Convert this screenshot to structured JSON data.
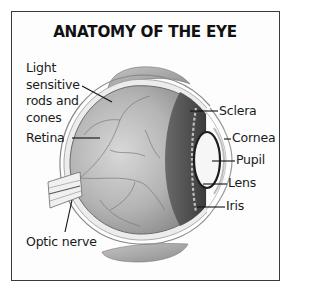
{
  "title": "ANATOMY OF THE EYE",
  "labels": {
    "light_sensitive": [
      "Light",
      "sensitive",
      "rods and",
      "cones"
    ],
    "retina": "Retina",
    "optic_nerve": "Optic nerve",
    "sclera": "Sclera",
    "cornea": "Cornea",
    "pupil": "Pupil",
    "lens": "Lens",
    "iris": "Iris"
  },
  "colors": {
    "frame": "#3a3a3a",
    "eyeball_fill": "#b8b8b8",
    "iris_dark": "#4a4a4a",
    "lens_fill": "#f4f4f4",
    "eyelid": "#9a9a9a"
  }
}
